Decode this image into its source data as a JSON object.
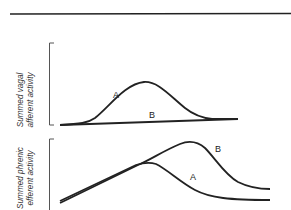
{
  "figure": {
    "top_panel": {
      "ylabel_line1": "Summed vagal",
      "ylabel_line2": "afferent activity",
      "curve_a_label": "A",
      "curve_b_label": "B"
    },
    "bottom_panel": {
      "ylabel_line1": "Summed phrenic",
      "ylabel_line2": "efferent activity",
      "curve_a_label": "A",
      "curve_b_label": "B"
    },
    "colors": {
      "line": "#222222",
      "axis": "#555555",
      "text": "#333333"
    }
  }
}
